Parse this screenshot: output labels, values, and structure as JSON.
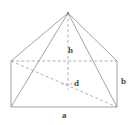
{
  "figure": {
    "name": "pyramid-in-rectangular-prism",
    "colors": {
      "solid_edge": "#8c8c96",
      "hidden_edge": "#9a9aa4",
      "label_text": "#4a4a4a",
      "background": "#ffffff"
    },
    "labels": [
      {
        "id": "h",
        "text": "h",
        "meaning": "height"
      },
      {
        "id": "d",
        "text": "d",
        "meaning": "base-diagonal"
      },
      {
        "id": "a",
        "text": "a",
        "meaning": "base-length"
      },
      {
        "id": "b",
        "text": "b",
        "meaning": "base-width"
      }
    ],
    "vertices": {
      "apex": [
        68,
        13
      ],
      "front_bottom_left": [
        11,
        107
      ],
      "front_bottom_right": [
        117,
        107
      ],
      "front_top_left": [
        11,
        61
      ],
      "front_top_right": [
        117,
        61
      ],
      "back_bottom_left": [
        30,
        92
      ],
      "back_bottom_right": [
        99,
        92
      ],
      "back_top_left": [
        30,
        61
      ],
      "back_top_right": [
        99,
        61
      ],
      "base_center": [
        64,
        84
      ]
    }
  }
}
